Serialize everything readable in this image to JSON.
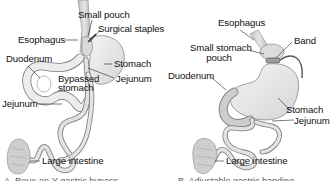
{
  "figure": {
    "panels": [
      {
        "id": "gastric-bypass",
        "labels": {
          "small_pouch": "Small pouch",
          "surgical_staples": "Surgical staples",
          "esophagus": "Esophagus",
          "duodenum": "Duodenum",
          "stomach": "Stomach",
          "jejunum_upper": "Jejunum",
          "bypassed_stomach_1": "Bypassed",
          "bypassed_stomach_2": "stomach",
          "jejunum_lower": "Jejunum",
          "large_intestine": "Large intestine"
        },
        "caption": "A. Roux-en-Y gastric bypass"
      },
      {
        "id": "gastric-banding",
        "labels": {
          "esophagus": "Esophagus",
          "band": "Band",
          "small_stomach_pouch_1": "Small stomach",
          "small_stomach_pouch_2": "pouch",
          "duodenum": "Duodenum",
          "stomach": "Stomach",
          "jejunum": "Jejunum",
          "large_intestine": "Large intestine"
        },
        "caption": "B. Adjustable gastric banding"
      }
    ],
    "colors": {
      "organ_fill": "#e9e9e9",
      "organ_stroke": "#7a7a7a",
      "organ_shade": "#c8c8c8",
      "leader_line": "#222222",
      "text": "#111111",
      "background": "#ffffff"
    }
  }
}
